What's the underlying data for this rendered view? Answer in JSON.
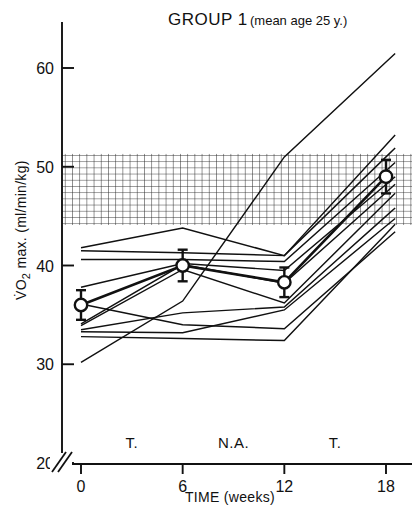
{
  "chart_data": {
    "type": "line",
    "title": "GROUP 1 (mean age 25 y.)",
    "title_main": "GROUP 1",
    "title_paren": "(mean age 25 y.)",
    "xlabel": "TIME (weeks)",
    "ylabel_main": "VO",
    "ylabel_sub": "2",
    "ylabel_rest": " max.",
    "ylabel_units": "(ml/min/kg)",
    "ylabel_full": "VO2 max. (ml/min/kg)",
    "x": [
      0,
      6,
      12,
      18
    ],
    "xticklabels": [
      "0",
      "6",
      "12",
      "18"
    ],
    "yticks": [
      20,
      30,
      40,
      50,
      60
    ],
    "yticklabels": [
      "20",
      "30",
      "40",
      "50",
      "60"
    ],
    "xlim": [
      0,
      19.2
    ],
    "ylim": [
      20,
      63
    ],
    "axis_break": true,
    "grid": false,
    "legend": false,
    "phase_annotations": [
      {
        "label": "T.",
        "x": 3
      },
      {
        "label": "N.A.",
        "x": 9
      },
      {
        "label": "T.",
        "x": 15
      }
    ],
    "reference_band": {
      "label": "hatched reference band",
      "ymin": 44.1,
      "ymax": 51.3,
      "hatch": "crosshatch"
    },
    "mean_series": {
      "name": "mean ± SE",
      "marker": "open-circle",
      "values": [
        36.0,
        40.0,
        38.3,
        49.0
      ],
      "errors": [
        1.5,
        1.6,
        1.5,
        1.7
      ]
    },
    "series": [
      {
        "name": "subject-1",
        "values": [
          41.8,
          43.8,
          41.0,
          52.2
        ]
      },
      {
        "name": "subject-2",
        "values": [
          41.5,
          41.3,
          41.0,
          51.0
        ]
      },
      {
        "name": "subject-3",
        "values": [
          40.6,
          40.6,
          40.4,
          49.6
        ]
      },
      {
        "name": "subject-4",
        "values": [
          37.8,
          40.2,
          39.5,
          48.2
        ]
      },
      {
        "name": "subject-5",
        "values": [
          34.1,
          40.1,
          38.2,
          47.4
        ]
      },
      {
        "name": "subject-6",
        "values": [
          33.9,
          39.6,
          36.2,
          46.4
        ]
      },
      {
        "name": "subject-7",
        "values": [
          33.5,
          35.2,
          35.8,
          45.0
        ]
      },
      {
        "name": "subject-8",
        "values": [
          33.3,
          33.2,
          35.5,
          44.0
        ]
      },
      {
        "name": "subject-9",
        "values": [
          30.2,
          36.4,
          51.0,
          60.6
        ]
      },
      {
        "name": "subject-10",
        "values": [
          32.8,
          32.6,
          32.4,
          43.2
        ]
      },
      {
        "name": "subject-11",
        "values": [
          36.1,
          34.0,
          33.6,
          42.6
        ]
      }
    ],
    "colors": {
      "line": "#111111",
      "axis": "#111111",
      "band": "#333333",
      "background": "#ffffff"
    }
  }
}
